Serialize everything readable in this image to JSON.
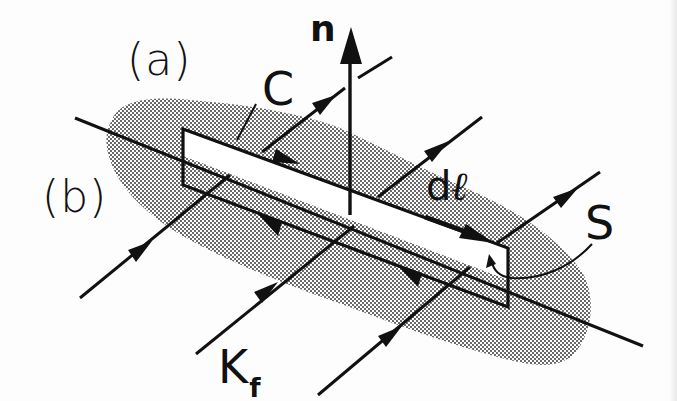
{
  "figure": {
    "labels": {
      "panel_a": "(a)",
      "panel_b": "(b)",
      "normal": "n",
      "contour": "C",
      "line_element_d": "d",
      "line_element_l": "ℓ",
      "surface": "S",
      "current_K": "K",
      "current_sub": "f"
    },
    "colors": {
      "ink": "#111111",
      "background": "#fdfdfd",
      "stipple": "#2a2a2a"
    },
    "elements": {
      "surface_blob": "stippled surface representing the interface",
      "interface_line": "solid line along the interface",
      "contour_rectangle": "rectangular loop C straddling the interface",
      "normal_vector": "vertical arrow n",
      "current_lines": [
        "surface current line 1",
        "surface current line 2",
        "surface current line 3"
      ]
    }
  }
}
